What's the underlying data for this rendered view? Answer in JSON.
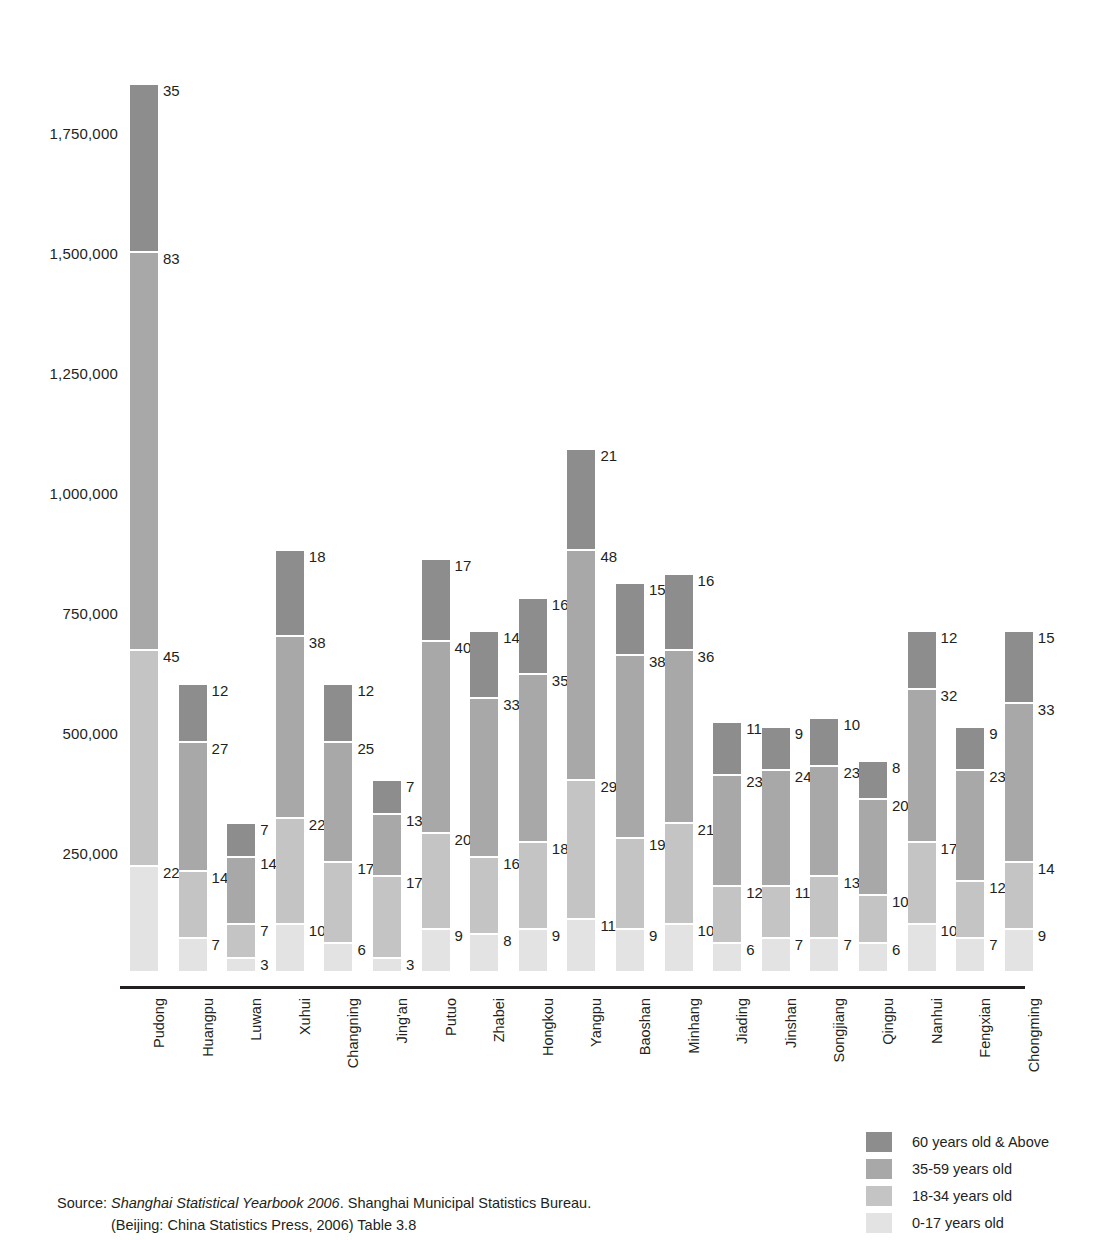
{
  "chart_data": {
    "type": "bar",
    "subtype": "stacked-vertical",
    "title": "",
    "xlabel": "",
    "ylabel": "",
    "ylim": [
      0,
      1850000
    ],
    "yticks": [
      "250,000",
      "500,000",
      "750,000",
      "1,000,000",
      "1,250,000",
      "1,500,000",
      "1,750,000"
    ],
    "ytick_values": [
      250000,
      500000,
      750000,
      1000000,
      1250000,
      1500000,
      1750000
    ],
    "grid": false,
    "value_units": "ten thousands (data labels shown as 10,000 persons)",
    "legend_position": "bottom-right",
    "categories": [
      "Pudong",
      "Huangpu",
      "Luwan",
      "Xuhui",
      "Changning",
      "Jing'an",
      "Putuo",
      "Zhabei",
      "Hongkou",
      "Yangpu",
      "Baoshan",
      "Minhang",
      "Jiading",
      "Jinshan",
      "Songjiang",
      "Qingpu",
      "Nanhui",
      "Fengxian",
      "Chongming"
    ],
    "series": [
      {
        "name": "60 years old & Above",
        "color": "#8d8d8d",
        "key": "c60",
        "values": [
          35,
          12,
          7,
          18,
          12,
          7,
          17,
          14,
          16,
          21,
          15,
          16,
          11,
          9,
          10,
          8,
          12,
          9,
          15
        ]
      },
      {
        "name": "35-59 years old",
        "color": "#a8a8a8",
        "key": "c35",
        "values": [
          83,
          27,
          14,
          38,
          25,
          13,
          40,
          33,
          35,
          48,
          38,
          36,
          23,
          24,
          23,
          20,
          32,
          23,
          33
        ]
      },
      {
        "name": "18-34 years old",
        "color": "#c4c4c4",
        "key": "c18",
        "values": [
          45,
          14,
          7,
          22,
          17,
          17,
          20,
          16,
          18,
          29,
          19,
          21,
          12,
          11,
          13,
          10,
          17,
          12,
          14
        ]
      },
      {
        "name": "0-17 years old",
        "color": "#e3e3e3",
        "key": "c00",
        "values": [
          22,
          7,
          3,
          10,
          6,
          3,
          9,
          8,
          9,
          11,
          9,
          10,
          6,
          7,
          7,
          6,
          10,
          7,
          9
        ]
      }
    ],
    "totals": [
      185,
      60,
      31,
      88,
      60,
      40,
      86,
      71,
      78,
      109,
      81,
      83,
      52,
      51,
      53,
      44,
      71,
      51,
      71
    ]
  },
  "legend": {
    "items": [
      {
        "label": "60 years old & Above",
        "color": "#8d8d8d"
      },
      {
        "label": "35-59 years old",
        "color": "#a8a8a8"
      },
      {
        "label": "18-34 years old",
        "color": "#c4c4c4"
      },
      {
        "label": "0-17 years old",
        "color": "#e3e3e3"
      }
    ]
  },
  "source": {
    "label": "Source:",
    "italic_title": "Shanghai Statistical Yearbook 2006",
    "line1_rest": ". Shanghai Municipal Statistics Bureau.",
    "line2": "(Beijing: China Statistics Press, 2006) Table 3.8"
  }
}
